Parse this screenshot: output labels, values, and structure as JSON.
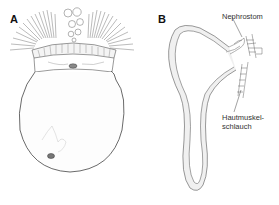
{
  "panels": [
    {
      "label": "A",
      "subject": "trochophore-larva"
    },
    {
      "label": "B",
      "subject": "nephridium"
    }
  ],
  "annotations": {
    "nephrostom": "Nephrostom",
    "hautmuskel_line1": "Hautmuskel-",
    "hautmuskel_line2": "schlauch"
  },
  "colors": {
    "line": "#555555",
    "stipple": "#bdbdbd",
    "background": "#ffffff"
  }
}
